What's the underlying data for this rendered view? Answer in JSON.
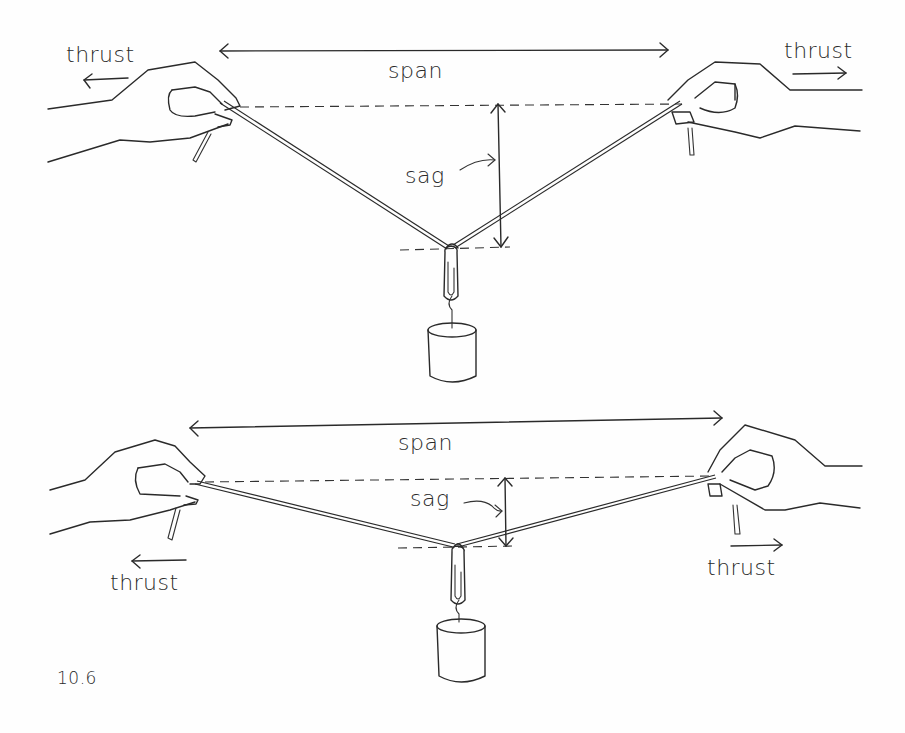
{
  "figure": {
    "number": "10.6",
    "diagrams": [
      {
        "id": "top",
        "labels": {
          "span": "span",
          "sag": "sag",
          "thrust_left": "thrust",
          "thrust_right": "thrust"
        },
        "description": "Deep sag: string held between two hands with a weight hanging from a paper clip at the center"
      },
      {
        "id": "bottom",
        "labels": {
          "span": "span",
          "sag": "sag",
          "thrust_left": "thrust",
          "thrust_right": "thrust"
        },
        "description": "Shallow sag: same span pulled tighter, smaller sag"
      }
    ]
  },
  "colors": {
    "ink": "#2a2a2a",
    "paper": "#fefefe"
  }
}
